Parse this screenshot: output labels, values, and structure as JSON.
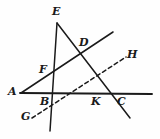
{
  "figure": {
    "name": "geometry-diagram",
    "width": 160,
    "height": 139,
    "background_color": "#fefefe",
    "stroke_color": "#1a1a1a",
    "label_color": "#1a1a1a"
  },
  "points": [
    {
      "id": "A",
      "label": "A",
      "x": 22,
      "y": 93,
      "label_x": 8,
      "label_y": 86
    },
    {
      "id": "B",
      "label": "B",
      "x": 50,
      "y": 93,
      "label_x": 40,
      "label_y": 96
    },
    {
      "id": "C",
      "label": "C",
      "x": 122,
      "y": 93,
      "label_x": 117,
      "label_y": 96
    },
    {
      "id": "D",
      "label": "D",
      "x": 80,
      "y": 45,
      "label_x": 79,
      "label_y": 37
    },
    {
      "id": "E",
      "label": "E",
      "x": 57,
      "y": 23,
      "label_x": 52,
      "label_y": 6
    },
    {
      "id": "F",
      "label": "F",
      "x": 50,
      "y": 72,
      "label_x": 39,
      "label_y": 64
    },
    {
      "id": "G",
      "label": "G",
      "x": 33,
      "y": 117,
      "label_x": 21,
      "label_y": 111
    },
    {
      "id": "H",
      "label": "H",
      "x": 125,
      "y": 58,
      "label_x": 127,
      "label_y": 49
    },
    {
      "id": "K",
      "label": "K",
      "x": 96,
      "y": 93,
      "label_x": 91,
      "label_y": 96
    }
  ],
  "segments": [
    {
      "id": "line-AC",
      "name": "line-a-c",
      "from": "A",
      "to": "C",
      "style": "solid",
      "x1": 20,
      "y1": 93,
      "x2": 152,
      "y2": 94
    },
    {
      "id": "line-AD",
      "name": "line-a-f-d",
      "from": "A",
      "to": "D",
      "style": "solid",
      "x1": 21,
      "y1": 93,
      "x2": 113,
      "y2": 32
    },
    {
      "id": "line-EB",
      "name": "line-e-b",
      "from": "E",
      "to": "B",
      "style": "solid",
      "x1": 57,
      "y1": 23,
      "x2": 50,
      "y2": 131
    },
    {
      "id": "line-EC",
      "name": "line-e-d-c",
      "from": "E",
      "to": "C",
      "style": "solid",
      "x1": 57,
      "y1": 23,
      "x2": 130,
      "y2": 118
    },
    {
      "id": "line-GH",
      "name": "line-g-h",
      "from": "G",
      "to": "H",
      "style": "dashed",
      "x1": 32,
      "y1": 118,
      "x2": 126,
      "y2": 57
    }
  ]
}
